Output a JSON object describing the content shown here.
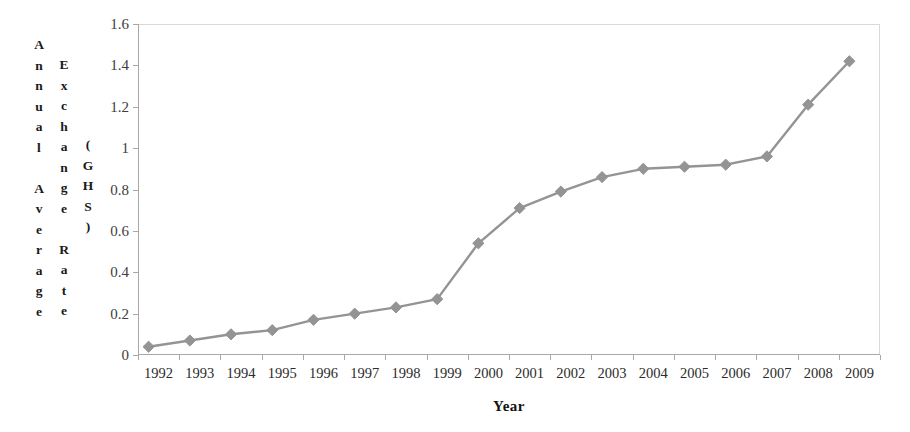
{
  "chart_data": {
    "type": "line",
    "title": "",
    "subtitle": "",
    "xlabel": "Year",
    "ylabel": "Annual Average Exchange Rate (GHS)",
    "ylabel_columns": [
      "Annual Average",
      "Exchange Rate",
      "(GHS)"
    ],
    "categories": [
      "1992",
      "1993",
      "1994",
      "1995",
      "1996",
      "1997",
      "1998",
      "1999",
      "2000",
      "2001",
      "2002",
      "2003",
      "2004",
      "2005",
      "2006",
      "2007",
      "2008",
      "2009"
    ],
    "values": [
      0.04,
      0.07,
      0.1,
      0.12,
      0.17,
      0.2,
      0.23,
      0.27,
      0.54,
      0.71,
      0.79,
      0.86,
      0.9,
      0.91,
      0.92,
      0.96,
      1.21,
      1.42
    ],
    "series": [
      {
        "name": "Annual Average Exchange Rate (GHS)",
        "values": [
          0.04,
          0.07,
          0.1,
          0.12,
          0.17,
          0.2,
          0.23,
          0.27,
          0.54,
          0.71,
          0.79,
          0.86,
          0.9,
          0.91,
          0.92,
          0.96,
          1.21,
          1.42
        ]
      }
    ],
    "ylim": [
      0,
      1.6
    ],
    "ytick_labels": [
      "0",
      "0.2",
      "0.4",
      "0.6",
      "0.8",
      "1",
      "1.2",
      "1.4",
      "1.6"
    ],
    "ytick_values": [
      0,
      0.2,
      0.4,
      0.6,
      0.8,
      1,
      1.2,
      1.4,
      1.6
    ],
    "grid": false,
    "legend": false,
    "legend_position": "none",
    "marker": "diamond",
    "series_color": "#949494",
    "axis_color": "#a8a8a8",
    "text_color": "#1a1a1a"
  },
  "figure": {
    "border_color": "#8d8d8d"
  }
}
